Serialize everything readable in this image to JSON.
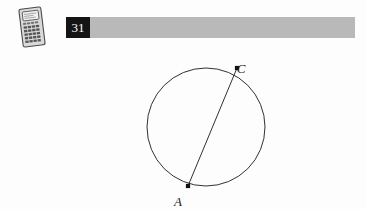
{
  "page": {
    "background_color": "#fdfdfd",
    "width": 366,
    "height": 209
  },
  "header": {
    "icon": "graphing-calculator-icon",
    "problem_number": "31",
    "number_box_color": "#141414",
    "number_text_color": "#ffffff",
    "rule_bar_color": "#b9b9b9"
  },
  "figure": {
    "type": "circle-with-chord",
    "stroke_color": "#1a1a1a",
    "fill_color": "none",
    "circle": {
      "cx": 206,
      "cy": 87,
      "r": 59
    },
    "chord": {
      "from": "A",
      "to": "C"
    },
    "points": [
      {
        "label": "A",
        "x": 188,
        "y": 146,
        "label_x": 178,
        "label_y": 155,
        "marker": "square-dot"
      },
      {
        "label": "C",
        "x": 237,
        "y": 28,
        "label_x": 241,
        "label_y": 22,
        "marker": "square-dot"
      }
    ]
  }
}
